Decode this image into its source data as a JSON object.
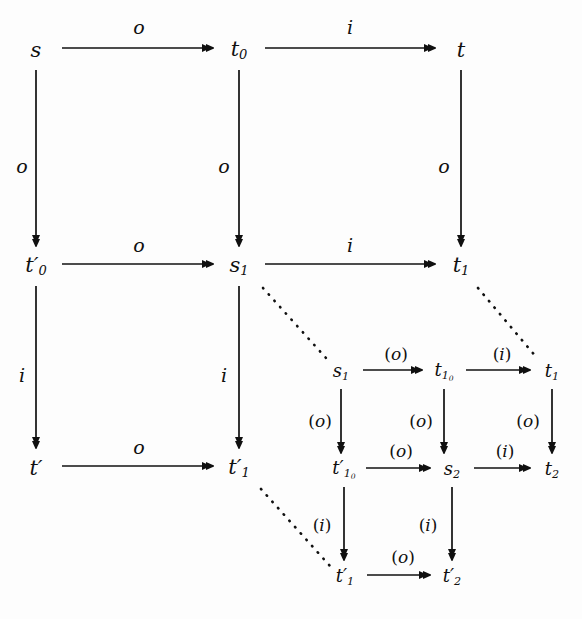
{
  "figure": {
    "kind": "commutative-diagram",
    "background_color": "#fdfdfd",
    "ink_color": "#101010",
    "width": 582,
    "height": 619
  },
  "outer_nodes": [
    {
      "id": "s",
      "label": "s",
      "x": 36,
      "y": 50
    },
    {
      "id": "t0",
      "label": "t",
      "sub": "0",
      "x": 239,
      "y": 50
    },
    {
      "id": "t",
      "label": "t",
      "x": 461,
      "y": 50
    },
    {
      "id": "t0p",
      "label": "t",
      "sub": "0",
      "prime": "′",
      "x": 36,
      "y": 266
    },
    {
      "id": "s1",
      "label": "s",
      "sub": "1",
      "x": 239,
      "y": 266
    },
    {
      "id": "t1",
      "label": "t",
      "sub": "1",
      "x": 461,
      "y": 266
    },
    {
      "id": "tp",
      "label": "t",
      "prime": "′",
      "x": 36,
      "y": 468
    },
    {
      "id": "t1p",
      "label": "t",
      "sub": "1",
      "prime": "′",
      "x": 239,
      "y": 468
    }
  ],
  "inner_nodes": [
    {
      "id": "is1",
      "label": "s",
      "sub": "1",
      "x": 341,
      "y": 372
    },
    {
      "id": "it10",
      "label": "t",
      "sub": "1",
      "subsub": "0",
      "x": 444,
      "y": 372
    },
    {
      "id": "it1",
      "label": "t",
      "sub": "1",
      "x": 552,
      "y": 372
    },
    {
      "id": "it10p",
      "label": "t",
      "sub": "1",
      "subsub": "0",
      "prime": "′",
      "x": 344,
      "y": 470
    },
    {
      "id": "is2",
      "label": "s",
      "sub": "2",
      "x": 452,
      "y": 470
    },
    {
      "id": "it2",
      "label": "t",
      "sub": "2",
      "x": 552,
      "y": 470
    },
    {
      "id": "it1p",
      "label": "t",
      "sub": "1",
      "prime": "′",
      "x": 345,
      "y": 577
    },
    {
      "id": "it2p",
      "label": "t",
      "sub": "2",
      "prime": "′",
      "x": 452,
      "y": 577
    }
  ],
  "outer_edges": [
    {
      "id": "s-t0",
      "from": "s",
      "to": "t0",
      "dir": "right",
      "label": "o",
      "lx": 139,
      "ly": 27
    },
    {
      "id": "t0-t",
      "from": "t0",
      "to": "t",
      "dir": "right",
      "label": "i",
      "lx": 350,
      "ly": 27
    },
    {
      "id": "s-t0p",
      "from": "s",
      "to": "t0p",
      "dir": "down",
      "label": "o",
      "lx": 22,
      "ly": 166
    },
    {
      "id": "t0-s1",
      "from": "t0",
      "to": "s1",
      "dir": "down",
      "label": "o",
      "lx": 224,
      "ly": 166
    },
    {
      "id": "t-t1",
      "from": "t",
      "to": "t1",
      "dir": "down",
      "label": "o",
      "lx": 444,
      "ly": 166
    },
    {
      "id": "t0p-s1",
      "from": "t0p",
      "to": "s1",
      "dir": "right",
      "label": "o",
      "lx": 139,
      "ly": 245
    },
    {
      "id": "s1-t1",
      "from": "s1",
      "to": "t1",
      "dir": "right",
      "label": "i",
      "lx": 350,
      "ly": 245
    },
    {
      "id": "t0p-tp",
      "from": "t0p",
      "to": "tp",
      "dir": "down",
      "label": "i",
      "lx": 22,
      "ly": 375
    },
    {
      "id": "s1-t1p",
      "from": "s1",
      "to": "t1p",
      "dir": "down",
      "label": "i",
      "lx": 224,
      "ly": 375
    },
    {
      "id": "tp-t1p",
      "from": "tp",
      "to": "t1p",
      "dir": "right",
      "label": "o",
      "lx": 139,
      "ly": 447
    }
  ],
  "inner_edges": [
    {
      "id": "is1-it10",
      "from": "is1",
      "to": "it10",
      "dir": "right",
      "label": "(o)",
      "lx": 396,
      "ly": 354
    },
    {
      "id": "it10-it1",
      "from": "it10",
      "to": "it1",
      "dir": "right",
      "label": "(i)",
      "lx": 502,
      "ly": 354
    },
    {
      "id": "is1-it10p",
      "from": "is1",
      "to": "it10p",
      "dir": "down",
      "label": "(o)",
      "lx": 320,
      "ly": 421
    },
    {
      "id": "it10-is2",
      "from": "it10",
      "to": "is2",
      "dir": "down",
      "label": "(o)",
      "lx": 421,
      "ly": 421
    },
    {
      "id": "it1-it2",
      "from": "it1",
      "to": "it2",
      "dir": "down",
      "label": "(o)",
      "lx": 528,
      "ly": 421
    },
    {
      "id": "it10p-is2",
      "from": "it10p",
      "to": "is2",
      "dir": "right",
      "label": "(o)",
      "lx": 401,
      "ly": 451
    },
    {
      "id": "is2-it2",
      "from": "is2",
      "to": "it2",
      "dir": "right",
      "label": "(i)",
      "lx": 505,
      "ly": 451
    },
    {
      "id": "it10p-it1p",
      "from": "it10p",
      "to": "it1p",
      "dir": "down",
      "label": "(i)",
      "lx": 322,
      "ly": 525
    },
    {
      "id": "is2-it2p",
      "from": "is2",
      "to": "it2p",
      "dir": "down",
      "label": "(i)",
      "lx": 428,
      "ly": 525
    },
    {
      "id": "it1p-it2p",
      "from": "it1p",
      "to": "it2p",
      "dir": "right",
      "label": "(o)",
      "lx": 403,
      "ly": 557
    }
  ],
  "dotted_links": [
    {
      "id": "link-s1",
      "from": "s1",
      "to": "is1",
      "x1": 263,
      "y1": 288,
      "x2": 326,
      "y2": 358
    },
    {
      "id": "link-t1",
      "from": "t1",
      "to": "it1",
      "x1": 478,
      "y1": 288,
      "x2": 537,
      "y2": 358
    },
    {
      "id": "link-t1p",
      "from": "t1p",
      "to": "it1p",
      "x1": 261,
      "y1": 489,
      "x2": 330,
      "y2": 566
    }
  ]
}
